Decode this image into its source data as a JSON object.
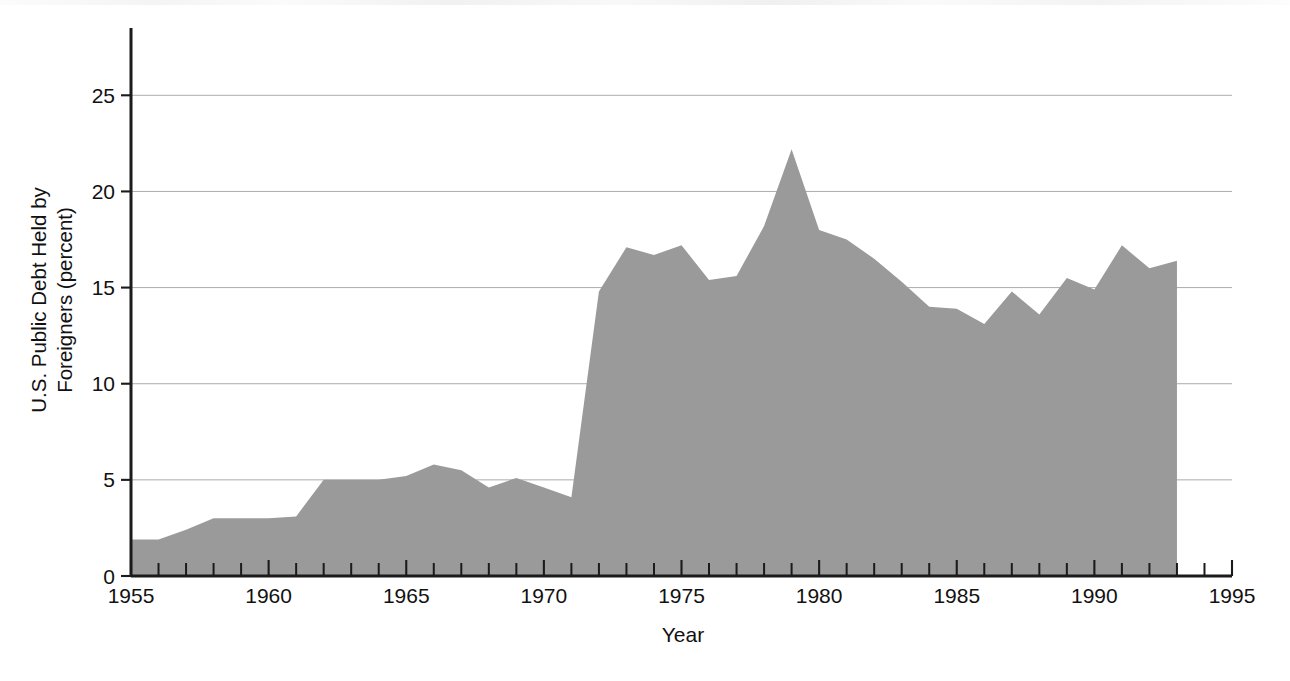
{
  "chart_data": {
    "type": "area",
    "title": "",
    "xlabel": "Year",
    "ylabel": "U.S. Public Debt Held by Foreigners (percent)",
    "ylabel_line1": "U.S. Public Debt Held by",
    "ylabel_line2": "Foreigners (percent)",
    "xlim": [
      1955,
      1995
    ],
    "ylim": [
      0,
      28.5
    ],
    "grid": "horizontal",
    "legend": "none",
    "fill_color": "#9a9a9a",
    "axis_color": "#1b1b1b",
    "grid_color": "#9e9e9e",
    "y_ticks": [
      0,
      5,
      10,
      15,
      20,
      25
    ],
    "y_tick_labels": [
      "0",
      "5",
      "10",
      "15",
      "20",
      "25"
    ],
    "x_ticks": [
      1955,
      1960,
      1965,
      1970,
      1975,
      1980,
      1985,
      1990,
      1995
    ],
    "x_tick_labels": [
      "1955",
      "1960",
      "1965",
      "1970",
      "1975",
      "1980",
      "1985",
      "1990",
      "1995"
    ],
    "x_minor_tick_interval": 1,
    "x": [
      1955,
      1956,
      1957,
      1958,
      1959,
      1960,
      1961,
      1962,
      1963,
      1964,
      1965,
      1966,
      1967,
      1968,
      1969,
      1970,
      1971,
      1972,
      1973,
      1974,
      1975,
      1976,
      1977,
      1978,
      1979,
      1980,
      1981,
      1982,
      1983,
      1984,
      1985,
      1986,
      1987,
      1988,
      1989,
      1990,
      1991,
      1992,
      1993
    ],
    "values": [
      1.9,
      1.9,
      2.4,
      3.0,
      3.0,
      3.0,
      3.1,
      5.0,
      5.0,
      5.0,
      5.2,
      5.8,
      5.5,
      4.6,
      5.1,
      4.6,
      4.1,
      14.8,
      17.1,
      16.7,
      17.2,
      15.4,
      15.6,
      18.2,
      22.2,
      18.0,
      17.5,
      16.5,
      15.3,
      14.0,
      13.9,
      13.1,
      14.8,
      13.6,
      15.5,
      14.9,
      17.2,
      16.0,
      16.4
    ],
    "series_name": "U.S. Public Debt Held by Foreigners",
    "data_end_year": 1993,
    "peak": {
      "year": 1979,
      "value": 22.2
    },
    "trough_early": {
      "year": 1955,
      "value": 1.9
    }
  },
  "figure": {
    "background_color": "#ffffff",
    "has_frame": false
  }
}
